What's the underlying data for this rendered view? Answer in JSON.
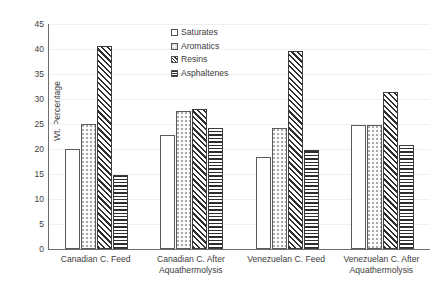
{
  "chart_data": {
    "type": "bar",
    "title": "",
    "xlabel": "",
    "ylabel": "Wt. Percentage",
    "ylim": [
      0,
      45
    ],
    "ytick_step": 5,
    "yticks": [
      0,
      5,
      10,
      15,
      20,
      25,
      30,
      35,
      40,
      45
    ],
    "grid": true,
    "legend_position": "upper-center",
    "categories": [
      "Canadian C. Feed",
      "Canadian C. After Aquathermolysis",
      "Venezuelan  C. Feed",
      "Venezuelan C. After Aquathermolysis"
    ],
    "category_lines": [
      [
        "Canadian C. Feed"
      ],
      [
        "Canadian C. After",
        "Aquathermolysis"
      ],
      [
        "Venezuelan  C. Feed"
      ],
      [
        "Venezuelan C. After",
        "Aquathermolysis"
      ]
    ],
    "series": [
      {
        "name": "Saturates",
        "pattern": "solid-white",
        "values": [
          20.0,
          22.8,
          18.4,
          24.8
        ]
      },
      {
        "name": "Aromatics",
        "pattern": "dotted",
        "values": [
          25.0,
          27.6,
          24.2,
          24.8
        ]
      },
      {
        "name": "Resins",
        "pattern": "diagonal-hatch",
        "values": [
          40.6,
          28.0,
          39.7,
          31.4
        ]
      },
      {
        "name": "Asphaltenes",
        "pattern": "horizontal-lines",
        "values": [
          14.8,
          24.2,
          19.8,
          20.8
        ]
      }
    ]
  },
  "colors": {
    "axis": "#6e6e6e",
    "gridline": "#efefef",
    "text": "#3d3d3d",
    "bar_outline": "#4a4a4a",
    "hatch": "#2e2e2e",
    "background": "#ffffff"
  }
}
